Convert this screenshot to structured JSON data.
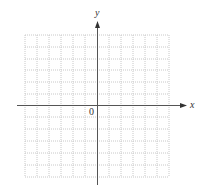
{
  "diagram": {
    "type": "coordinate-grid",
    "x_axis_label": "x",
    "y_axis_label": "y",
    "origin_label": "0",
    "grid": {
      "columns": 12,
      "rows": 12,
      "line_style": "dotted",
      "line_color": "#c8c8c8"
    },
    "axis_color": "#555555"
  }
}
